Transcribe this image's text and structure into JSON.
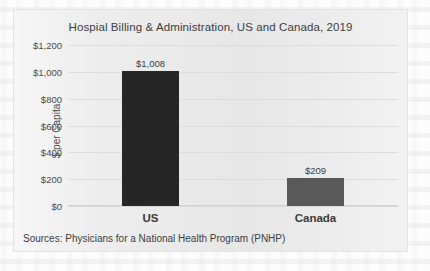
{
  "chart_data": {
    "type": "bar",
    "title": "Hospial Billing & Administration, US and Canada, 2019",
    "categories": [
      "US",
      "Canada"
    ],
    "values": [
      1008,
      209
    ],
    "value_labels": [
      "$1,008",
      "$209"
    ],
    "xlabel": "",
    "ylabel": "$ per Capita",
    "ylim": [
      0,
      1200
    ],
    "yticks": [
      1200,
      1000,
      800,
      600,
      400,
      200,
      0
    ],
    "ytick_labels": [
      "$1,200",
      "$1,000",
      "$800",
      "$600",
      "$400",
      "$200",
      "$0"
    ],
    "grid": true,
    "legend": false,
    "bar_colors": [
      "#262626",
      "#595959"
    ],
    "source": "Sources: Physicians for a National Health Program (PNHP)"
  },
  "colors": {
    "plot_background": "#ebebeb",
    "page_background": "#fdfdfd",
    "gridline": "#dcdcdc",
    "text": "#3d3d3d",
    "us_bar": "#262626",
    "canada_bar": "#595959"
  }
}
